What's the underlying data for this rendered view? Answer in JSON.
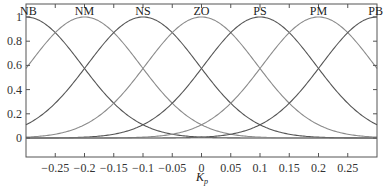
{
  "chart_data": {
    "type": "line",
    "title": "",
    "xlabel": "K_p",
    "ylabel": "",
    "xlim": [
      -0.3,
      0.3
    ],
    "ylim": [
      -0.15,
      1.1
    ],
    "grid": false,
    "legend_position": "none (labels above each curve peak)",
    "x_ticks": [
      -0.25,
      -0.2,
      -0.15,
      -0.1,
      -0.05,
      0,
      0.05,
      0.1,
      0.15,
      0.2,
      0.25
    ],
    "x_tick_labels": [
      "-0.25",
      "-0.2",
      "-0.15",
      "-0.1",
      "-0.05",
      "0",
      "0.05",
      "0.1",
      "0.15",
      "0.2",
      "0.25"
    ],
    "y_ticks": [
      0,
      0.2,
      0.4,
      0.6,
      0.8,
      1
    ],
    "y_tick_labels": [
      "0",
      "0.2",
      "0.4",
      "0.6",
      "0.8",
      "1"
    ],
    "membership_function": "gaussian",
    "sigma": 0.095,
    "series": [
      {
        "name": "NB",
        "center": -0.3,
        "color": "#555555"
      },
      {
        "name": "NM",
        "center": -0.2,
        "color": "#8a8a8a"
      },
      {
        "name": "NS",
        "center": -0.1,
        "color": "#555555"
      },
      {
        "name": "ZO",
        "center": 0.0,
        "color": "#8a8a8a"
      },
      {
        "name": "PS",
        "center": 0.1,
        "color": "#555555"
      },
      {
        "name": "PM",
        "center": 0.2,
        "color": "#8a8a8a"
      },
      {
        "name": "PB",
        "center": 0.3,
        "color": "#555555"
      }
    ],
    "sample_values": {
      "x": [
        -0.3,
        -0.25,
        -0.2,
        -0.15,
        -0.1,
        -0.05,
        0,
        0.05,
        0.1,
        0.15,
        0.2,
        0.25,
        0.3
      ],
      "NB": [
        1.0,
        0.87,
        0.57,
        0.29,
        0.11,
        0.03,
        0.007,
        0.001,
        0,
        0,
        0,
        0,
        0
      ],
      "NM": [
        0.57,
        0.87,
        1.0,
        0.87,
        0.57,
        0.29,
        0.11,
        0.03,
        0.007,
        0.001,
        0,
        0,
        0
      ],
      "NS": [
        0.11,
        0.29,
        0.57,
        0.87,
        1.0,
        0.87,
        0.57,
        0.29,
        0.11,
        0.03,
        0.007,
        0.001,
        0
      ],
      "ZO": [
        0.007,
        0.03,
        0.11,
        0.29,
        0.57,
        0.87,
        1.0,
        0.87,
        0.57,
        0.29,
        0.11,
        0.03,
        0.007
      ],
      "PS": [
        0,
        0.001,
        0.007,
        0.03,
        0.11,
        0.29,
        0.57,
        0.87,
        1.0,
        0.87,
        0.57,
        0.29,
        0.11
      ],
      "PM": [
        0,
        0,
        0,
        0.001,
        0.007,
        0.03,
        0.11,
        0.29,
        0.57,
        0.87,
        1.0,
        0.87,
        0.57
      ],
      "PB": [
        0,
        0,
        0,
        0,
        0,
        0.001,
        0.007,
        0.03,
        0.11,
        0.29,
        0.57,
        0.87,
        1.0
      ]
    }
  },
  "axis": {
    "xlabel_main": "K",
    "xlabel_sub": "p"
  }
}
